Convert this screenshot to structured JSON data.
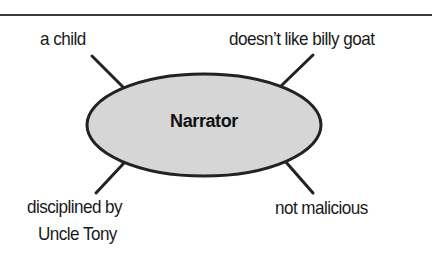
{
  "diagram": {
    "type": "character-web",
    "center": {
      "label": "Narrator",
      "fill": "#d6d6d6",
      "stroke": "#222222"
    },
    "attributes": [
      {
        "position": "top-left",
        "label": "a child"
      },
      {
        "position": "top-right",
        "label": "doesn’t like billy goat"
      },
      {
        "position": "bottom-left",
        "lines": [
          "disciplined by",
          "Uncle Tony"
        ]
      },
      {
        "position": "bottom-right",
        "label": "not malicious"
      }
    ]
  }
}
